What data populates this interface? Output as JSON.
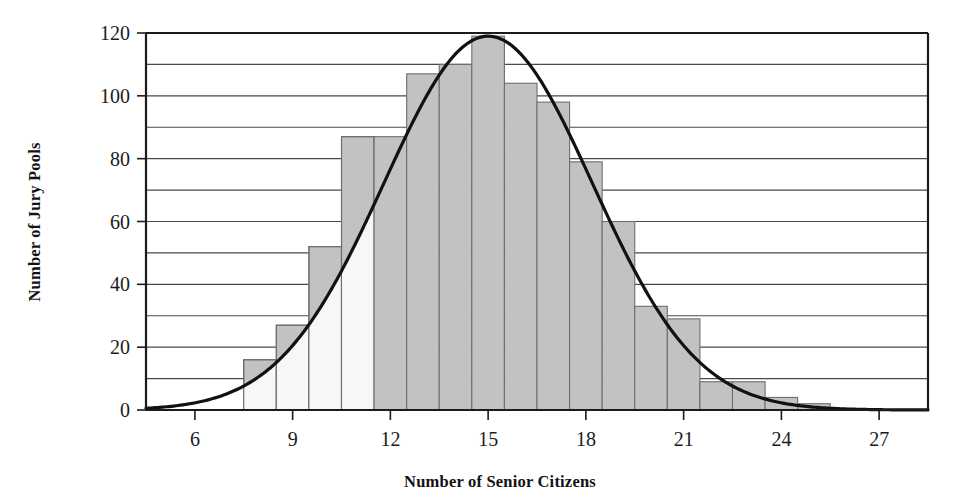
{
  "chart_data": {
    "type": "bar",
    "title": "",
    "xlabel": "Number of Senior Citizens",
    "ylabel": "Number of Jury Pools",
    "xlim": [
      4.5,
      28.5
    ],
    "ylim": [
      0,
      120
    ],
    "grid": true,
    "grid_step": 10,
    "legend": "none",
    "bar_width": 1,
    "categories": [
      8,
      9,
      10,
      11,
      12,
      13,
      14,
      15,
      16,
      17,
      18,
      19,
      20,
      21,
      22,
      23,
      24,
      25
    ],
    "values": [
      16,
      27,
      52,
      87,
      107,
      110,
      119,
      104,
      98,
      79,
      60,
      33,
      29,
      9,
      4,
      2,
      1,
      0
    ],
    "bins": [
      {
        "left": 7.5,
        "right": 8.5,
        "value": 16,
        "shaded": false
      },
      {
        "left": 8.5,
        "right": 9.5,
        "value": 27,
        "shaded": false
      },
      {
        "left": 9.5,
        "right": 10.5,
        "value": 52,
        "shaded": false
      },
      {
        "left": 10.5,
        "right": 11.5,
        "value": 87,
        "shaded": false
      },
      {
        "left": 11.5,
        "right": 12.5,
        "value": 87,
        "shaded": true
      },
      {
        "left": 12.5,
        "right": 13.5,
        "value": 107,
        "shaded": true
      },
      {
        "left": 13.5,
        "right": 14.5,
        "value": 110,
        "shaded": true
      },
      {
        "left": 14.5,
        "right": 15.5,
        "value": 119,
        "shaded": true
      },
      {
        "left": 15.5,
        "right": 16.5,
        "value": 104,
        "shaded": true
      },
      {
        "left": 16.5,
        "right": 17.5,
        "value": 98,
        "shaded": true
      },
      {
        "left": 17.5,
        "right": 18.5,
        "value": 79,
        "shaded": true
      },
      {
        "left": 18.5,
        "right": 19.5,
        "value": 60,
        "shaded": true
      },
      {
        "left": 19.5,
        "right": 20.5,
        "value": 33,
        "shaded": true
      },
      {
        "left": 20.5,
        "right": 21.5,
        "value": 29,
        "shaded": true
      },
      {
        "left": 21.5,
        "right": 22.5,
        "value": 9,
        "shaded": true
      },
      {
        "left": 22.5,
        "right": 23.5,
        "value": 9,
        "shaded": true
      },
      {
        "left": 23.5,
        "right": 24.5,
        "value": 4,
        "shaded": true
      },
      {
        "left": 24.5,
        "right": 25.5,
        "value": 2,
        "shaded": true
      }
    ],
    "xticks": [
      6,
      9,
      12,
      15,
      18,
      21,
      24,
      27
    ],
    "xtick_labels": [
      "6",
      "9",
      "12",
      "15",
      "18",
      "21",
      "24",
      "27"
    ],
    "yticks": [
      0,
      20,
      40,
      60,
      80,
      100,
      120
    ],
    "ytick_labels": [
      "0",
      "20",
      "40",
      "60",
      "80",
      "100",
      "120"
    ],
    "gridlines": [
      10,
      20,
      30,
      40,
      50,
      60,
      70,
      80,
      90,
      100,
      110,
      120
    ],
    "overlay_curve": {
      "name": "normal-approximation-curve",
      "type": "line",
      "mean": 15.0,
      "stdev": 3.2,
      "peak": 119,
      "color": "#111111",
      "line_width": 3.2
    },
    "colors": {
      "bar_fill": "#c2c2c2",
      "bar_fill_unshaded": "#f7f7f7",
      "bar_edge": "#6e6e6e",
      "axis": "#1b1b1b",
      "grid": "#4a4a4a",
      "curve": "#111111"
    }
  }
}
